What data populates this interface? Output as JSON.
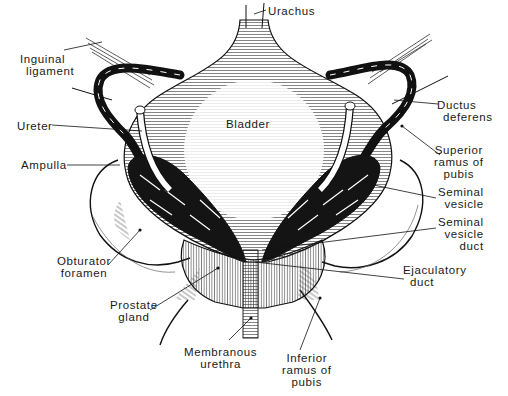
{
  "diagram": {
    "labels": {
      "urachus": "Urachus",
      "inguinal_ligament": [
        "Inguinal",
        "ligament"
      ],
      "ureter": "Ureter",
      "bladder": "Bladder",
      "ampulla": "Ampulla",
      "ductus_deferens": [
        "Ductus",
        "deferens"
      ],
      "superior_ramus": [
        "Superior",
        "ramus of",
        "pubis"
      ],
      "seminal_vesicle": [
        "Seminal",
        "vesicle"
      ],
      "seminal_vesicle_duct": [
        "Seminal",
        "vesicle",
        "duct"
      ],
      "obturator_foramen": [
        "Obturator",
        "foramen"
      ],
      "ejaculatory_duct": [
        "Ejaculatory",
        "duct"
      ],
      "prostate_gland": [
        "Prostate",
        "gland"
      ],
      "membranous_urethra": [
        "Membranous",
        "urethra"
      ],
      "inferior_ramus": [
        "Inferior",
        "ramus of",
        "pubis"
      ]
    },
    "colors": {
      "ink": "#1a1a1a",
      "background": "#ffffff"
    }
  }
}
